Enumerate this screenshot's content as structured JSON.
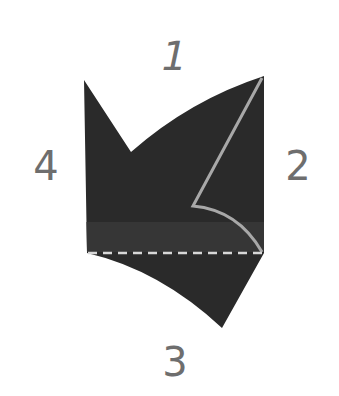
{
  "diagram": {
    "type": "paper-fold-shape",
    "colors": {
      "background": "#ffffff",
      "shape_fill": "#2a2a2a",
      "shape_band": "#363636",
      "fold_line": "#a8a8a8",
      "dashed_line": "#d8d8d8",
      "label": "#6e6e6e"
    },
    "labels": {
      "top": "1",
      "right": "2",
      "bottom": "3",
      "left": "4"
    }
  }
}
